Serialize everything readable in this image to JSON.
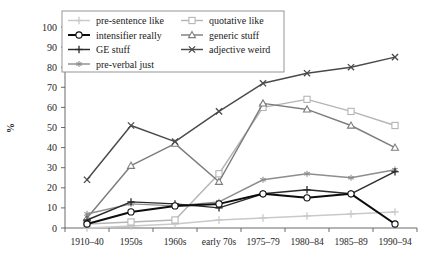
{
  "chart_data": {
    "type": "line",
    "title": "",
    "subtitle": "",
    "xlabel": "",
    "ylabel": "%",
    "ylim": [
      0,
      100
    ],
    "ytick_step": 10,
    "grid": false,
    "legend_position": "top-left-inside",
    "categories": [
      "1910–40",
      "1950s",
      "1960s",
      "early 70s",
      "1975–79",
      "1980–84",
      "1985–89",
      "1990–94"
    ],
    "yticks": [
      "0",
      "10",
      "20",
      "30",
      "40",
      "50",
      "60",
      "70",
      "80",
      "90",
      "100"
    ],
    "series": [
      {
        "name": "pre-sentence like",
        "values": [
          0,
          1,
          2,
          4,
          5,
          6,
          7,
          8
        ],
        "color": "#c9c9c9",
        "marker": "plus"
      },
      {
        "name": "quotative like",
        "values": [
          2,
          3,
          4,
          27,
          60,
          64,
          58,
          51
        ],
        "color": "#b5b5b5",
        "marker": "square"
      },
      {
        "name": "intensifier really",
        "values": [
          2,
          8,
          11,
          12,
          17,
          15,
          17,
          2
        ],
        "color": "#0d0d0d",
        "marker": "circle"
      },
      {
        "name": "generic stuff",
        "values": [
          5,
          31,
          42,
          23,
          62,
          59,
          51,
          40
        ],
        "color": "#7d7d7d",
        "marker": "triangle"
      },
      {
        "name": "GE stuff",
        "values": [
          4,
          13,
          12,
          10,
          17,
          19,
          17,
          28
        ],
        "color": "#2b2b2b",
        "marker": "plus"
      },
      {
        "name": "adjective weird",
        "values": [
          24,
          51,
          43,
          58,
          72,
          77,
          80,
          85
        ],
        "color": "#4a4a4a",
        "marker": "x"
      },
      {
        "name": "pre-verbal just",
        "values": [
          7,
          12,
          11,
          13,
          24,
          27,
          25,
          29
        ],
        "color": "#8e8e8e",
        "marker": "asterisk"
      }
    ],
    "legend_entries": [
      {
        "label": "pre-sentence like",
        "color": "#c9c9c9",
        "marker": "plus"
      },
      {
        "label": "quotative like",
        "color": "#b5b5b5",
        "marker": "square"
      },
      {
        "label": "intensifier really",
        "color": "#0d0d0d",
        "marker": "circle"
      },
      {
        "label": "generic stuff",
        "color": "#7d7d7d",
        "marker": "triangle"
      },
      {
        "label": "GE stuff",
        "color": "#2b2b2b",
        "marker": "plus"
      },
      {
        "label": "adjective weird",
        "color": "#4a4a4a",
        "marker": "x"
      },
      {
        "label": "pre-verbal just",
        "color": "#8e8e8e",
        "marker": "asterisk"
      }
    ]
  }
}
